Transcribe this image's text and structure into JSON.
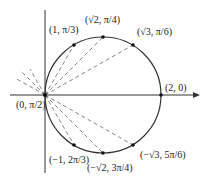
{
  "diagram": {
    "axis": {
      "origin_label": "(0, π/2)"
    },
    "points": [
      {
        "label": "(2, 0)"
      },
      {
        "label": "(1, π/3)"
      },
      {
        "label": "(√2, π/4)"
      },
      {
        "label": "(√3, π/6)"
      },
      {
        "label": "(−1, 2π/3)"
      },
      {
        "label": "(−√2, 3π/4)"
      },
      {
        "label": "(−√3, 5π/6)"
      }
    ],
    "colors": {
      "stroke": "#333333",
      "dash": "#666666"
    }
  }
}
